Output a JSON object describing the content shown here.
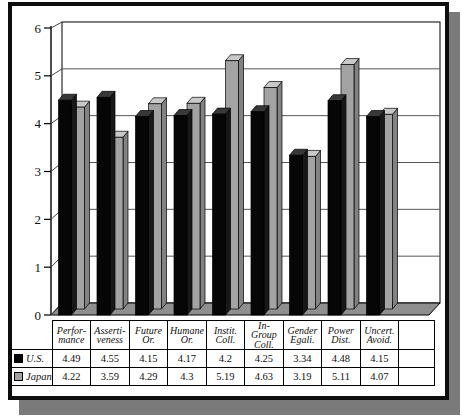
{
  "chart_data": {
    "type": "bar",
    "style": "3d-clustered-column",
    "title": "",
    "categories": [
      "Performance",
      "Assertiveness",
      "Future Or.",
      "Humane Or.",
      "Instit. Coll.",
      "In-Group Coll.",
      "Gender Egali.",
      "Power Dist.",
      "Uncert. Avoid."
    ],
    "category_label_lines": [
      [
        "Perfor-",
        "mance"
      ],
      [
        "Asserti-",
        "veness"
      ],
      [
        "Future",
        "Or."
      ],
      [
        "Humane",
        "Or."
      ],
      [
        "Instit.",
        "Coll."
      ],
      [
        "In-",
        "Group",
        "Coll."
      ],
      [
        "Gender",
        "Egali."
      ],
      [
        "Power",
        "Dist."
      ],
      [
        "Uncert.",
        "Avoid."
      ]
    ],
    "series": [
      {
        "name": "U.S.",
        "values": [
          4.49,
          4.55,
          4.15,
          4.17,
          4.2,
          4.25,
          3.34,
          4.48,
          4.15
        ],
        "values_text": [
          "4.49",
          "4.55",
          "4.15",
          "4.17",
          "4.2",
          "4.25",
          "3.34",
          "4.48",
          "4.15"
        ],
        "swatch_color": "#000000"
      },
      {
        "name": "Japan",
        "values": [
          4.22,
          3.59,
          4.29,
          4.3,
          5.19,
          4.63,
          3.19,
          5.11,
          4.07
        ],
        "values_text": [
          "4.22",
          "3.59",
          "4.29",
          "4.3",
          "5.19",
          "4.63",
          "3.19",
          "5.11",
          "4.07"
        ],
        "swatch_color": "#a3a3a3"
      }
    ],
    "ylim": [
      0,
      6
    ],
    "y_ticks": [
      "0",
      "1",
      "2",
      "3",
      "4",
      "5",
      "6"
    ],
    "grid": true,
    "legend_position": "left-of-data-table-rows",
    "data_table_shown": true,
    "empty_trailing_column": true
  },
  "colors": {
    "background": "#ffffff",
    "frame_border": "#0d0d0d",
    "frame_shadow": "#7a7a7a",
    "wall_fill": "#ffffff",
    "gridline": "#555555",
    "floor": "#8f8f8f",
    "us_bar_front": "#060606",
    "us_bar_top": "#383838",
    "us_bar_side": "#181818",
    "japan_bar_front": "#a3a3a3",
    "japan_bar_top": "#c9c9c9",
    "japan_bar_side": "#828282"
  }
}
